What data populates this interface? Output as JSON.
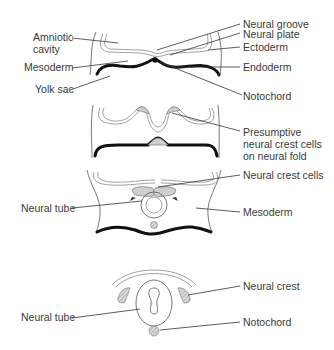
{
  "diagram": {
    "type": "embryology cross-section series",
    "panels": [
      {
        "id": "stage-1",
        "labels": {
          "amniotic_cavity_1": "Amniotic",
          "amniotic_cavity_2": "cavity",
          "mesoderm": "Mesoderm",
          "yolk_sac": "Yolk sac",
          "neural_groove": "Neural groove",
          "neural_plate": "Neural plate",
          "ectoderm": "Ectoderm",
          "endoderm": "Endoderm",
          "notochord": "Notochord"
        }
      },
      {
        "id": "stage-2",
        "labels": {
          "presumptive_1": "Presumptive",
          "presumptive_2": "neural crest cells",
          "presumptive_3": "on neural fold"
        }
      },
      {
        "id": "stage-3",
        "labels": {
          "neural_crest_cells": "Neural crest cells",
          "neural_tube": "Neural tube",
          "mesoderm": "Mesoderm"
        }
      },
      {
        "id": "stage-4",
        "labels": {
          "neural_crest": "Neural crest",
          "neural_tube": "Neural tube",
          "notochord": "Notochord"
        }
      }
    ]
  }
}
